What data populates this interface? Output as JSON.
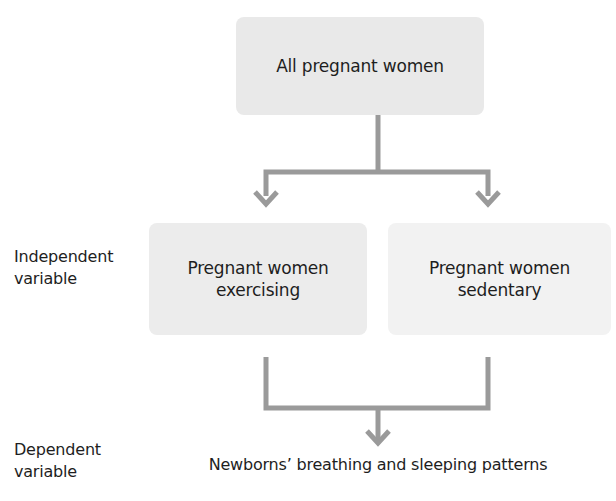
{
  "diagram": {
    "top_box": {
      "label": "All pregnant women"
    },
    "middle_boxes": [
      {
        "line1": "Pregnant women",
        "line2": "exercising"
      },
      {
        "line1": "Pregnant women",
        "line2": "sedentary"
      }
    ],
    "row_labels": {
      "independent": {
        "line1": "Independent",
        "line2": "variable"
      },
      "dependent": {
        "line1": "Dependent",
        "line2": "variable"
      }
    },
    "outcome": {
      "label": "Newborns’ breathing and sleeping patterns"
    },
    "colors": {
      "connector": "#9a9a9a",
      "top_box": "#e9e9e9",
      "left_box": "#ececec",
      "right_box": "#f2f2f2",
      "text": "#1e1e1e"
    }
  }
}
